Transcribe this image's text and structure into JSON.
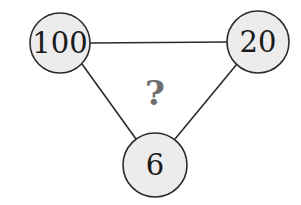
{
  "puzzle": {
    "nodes": [
      {
        "id": "top-left",
        "label": "100",
        "cx": 60,
        "cy": 43,
        "r": 30
      },
      {
        "id": "top-right",
        "label": "20",
        "cx": 258,
        "cy": 42,
        "r": 31
      },
      {
        "id": "bottom",
        "label": "6",
        "cx": 155,
        "cy": 165,
        "r": 32
      }
    ],
    "center_label": "?",
    "colors": {
      "node_fill": "#ececec",
      "stroke": "#2a2a2a",
      "question_mark": "#6e6e6e"
    }
  }
}
